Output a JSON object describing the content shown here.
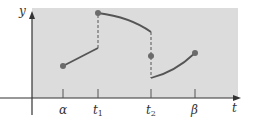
{
  "diagram": {
    "colors": {
      "background_region": "#dcdcdc",
      "axis": "#333333",
      "curve": "#555555",
      "dashed": "#555555",
      "dot": "#6b6b6b"
    },
    "axes": {
      "x_label": "t",
      "y_label": "y"
    },
    "ticks": [
      {
        "label": "α",
        "sub": "",
        "x": 63
      },
      {
        "label": "t",
        "sub": "1",
        "x": 98
      },
      {
        "label": "t",
        "sub": "2",
        "x": 151
      },
      {
        "label": "β",
        "sub": "",
        "x": 195
      }
    ],
    "segments": [
      {
        "name": "segment-alpha-to-t1",
        "from": "α",
        "to": "t1",
        "shape": "increasing line",
        "start_dot": true
      },
      {
        "name": "segment-t1-to-t2",
        "from": "t1",
        "to": "t2",
        "shape": "decreasing concave-down curve",
        "start_dot": true
      },
      {
        "name": "segment-t2-to-beta",
        "from": "t2",
        "to": "β",
        "shape": "increasing concave-up curve",
        "end_dot": true
      }
    ],
    "isolated_point": {
      "at": "t2",
      "description": "function value at t2 between one-sided limits"
    },
    "jumps": [
      {
        "at": "t1",
        "style": "dashed"
      },
      {
        "at": "t2",
        "style": "dashed"
      }
    ]
  }
}
